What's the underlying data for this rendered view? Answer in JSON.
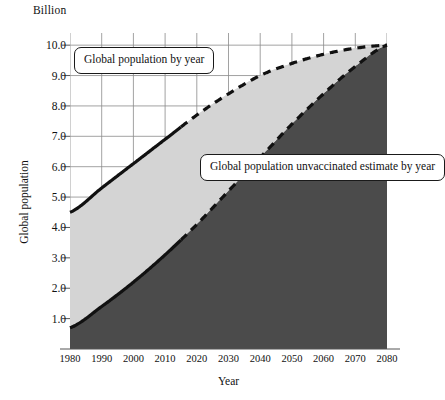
{
  "chart_data": {
    "type": "area",
    "title": "",
    "unit_label": "Billion",
    "xlabel": "Year",
    "ylabel": "Global population",
    "xlim": [
      1980,
      2080
    ],
    "ylim": [
      0,
      10.4
    ],
    "grid": true,
    "legend_position": "inline-callouts",
    "x_ticks": [
      1980,
      1990,
      2000,
      2010,
      2020,
      2030,
      2040,
      2050,
      2060,
      2070,
      2080
    ],
    "y_ticks": [
      1.0,
      2.0,
      3.0,
      4.0,
      5.0,
      6.0,
      7.0,
      8.0,
      9.0,
      10.0
    ],
    "y_tick_labels": [
      "1.0",
      "2.0",
      "3.0",
      "4.0",
      "5.0",
      "6.0",
      "7.0",
      "8.0",
      "9.0",
      "10.0"
    ],
    "x_tick_labels": [
      "1980",
      "1990",
      "2000",
      "2010",
      "2020",
      "2030",
      "2040",
      "2050",
      "2060",
      "2070",
      "2080"
    ],
    "x": [
      1980,
      1990,
      2000,
      2010,
      2020,
      2030,
      2040,
      2050,
      2060,
      2070,
      2080
    ],
    "series": [
      {
        "name": "Global population by year",
        "values": [
          4.5,
          5.3,
          6.1,
          6.9,
          7.7,
          8.4,
          9.0,
          9.4,
          9.7,
          9.9,
          10.0
        ],
        "fill_color": "#d4d4d4",
        "line_color": "#111111",
        "line_style_historical": "solid",
        "line_style_projected": "dashed",
        "projection_starts": 2015
      },
      {
        "name": "Global population unvaccinated estimate by year",
        "values": [
          0.7,
          1.4,
          2.2,
          3.1,
          4.1,
          5.2,
          6.3,
          7.4,
          8.4,
          9.3,
          10.0
        ],
        "fill_color": "#4b4b4b",
        "line_color": "#111111",
        "line_style_historical": "solid",
        "line_style_projected": "dashed",
        "projection_starts": 2015
      }
    ],
    "annotations": [
      {
        "id": "callout-upper",
        "text": "Global population by year"
      },
      {
        "id": "callout-lower",
        "text": "Global population unvaccinated estimate by year"
      }
    ]
  },
  "colors": {
    "upper_fill": "#d4d4d4",
    "lower_fill": "#4b4b4b",
    "line": "#111111",
    "grid": "#8a8a8a",
    "axis": "#555555",
    "background": "#ffffff"
  }
}
